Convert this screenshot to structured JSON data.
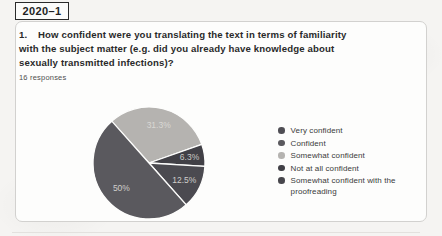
{
  "badge": {
    "label": "2020–1"
  },
  "card": {
    "question": {
      "number": "1.",
      "line1": "How confident were you translating the text in terms of familiarity",
      "line2": "with the subject matter (e.g. did you already have knowledge about",
      "line3": "sexually transmitted infections)?"
    },
    "responses_label": "16 responses"
  },
  "chart_data": {
    "type": "pie",
    "responses_count": 16,
    "legend_position": "right",
    "pie": {
      "cx": 149,
      "cy": 163,
      "r": 56,
      "start_angle_deg": -42
    },
    "slices": [
      {
        "legend_label": "Somewhat confident",
        "pct": 31.3,
        "display": "31.3%",
        "color": "#b5b3b0",
        "label_color": "#d9d8d4"
      },
      {
        "legend_label": "Not at all confident",
        "pct": 6.3,
        "display": "6.3%",
        "color": "#414046",
        "label_color": "#c9c8c5"
      },
      {
        "legend_label": "Somewhat confident with the proofreading",
        "pct": 12.5,
        "display": "12.5%",
        "color": "#4b4a50",
        "label_color": "#cfcecb"
      },
      {
        "legend_label": "Confident",
        "pct": 50,
        "display": "50%",
        "color": "#5a595e",
        "label_color": "#cfcecb"
      }
    ],
    "legend": [
      {
        "label": "Very confident",
        "color": "#4f4e54"
      },
      {
        "label": "Confident",
        "color": "#5a595e"
      },
      {
        "label": "Somewhat confident",
        "color": "#b5b3b0"
      },
      {
        "label": "Not at all confident",
        "color": "#414046"
      },
      {
        "label": "Somewhat confident with the proofreading",
        "color": "#47464c"
      }
    ]
  }
}
